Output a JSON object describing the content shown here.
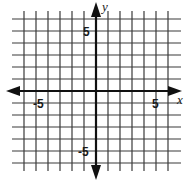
{
  "diagram": {
    "type": "coordinate-plane",
    "x_range": [
      -6,
      6
    ],
    "y_range": [
      -6,
      6
    ],
    "grid_step": 1,
    "axes": {
      "x_label": "x",
      "y_label": "y"
    },
    "tick_labels": {
      "x_neg": "-5",
      "x_pos": "5",
      "y_pos": "5",
      "y_neg": "-5"
    },
    "colors": {
      "grid": "#3a3a3a",
      "axis": "#111111",
      "background": "#ffffff"
    }
  }
}
